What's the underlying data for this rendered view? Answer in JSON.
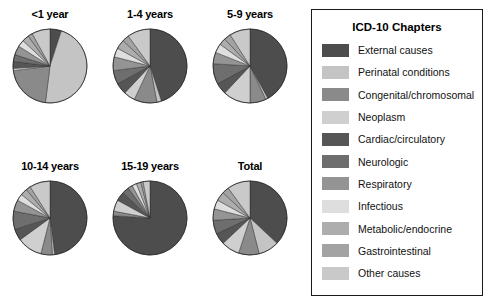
{
  "legend": {
    "title": "ICD-10 Chapters",
    "items": [
      {
        "label": "External causes",
        "color": "#4d4d4d"
      },
      {
        "label": "Perinatal conditions",
        "color": "#c4c4c4"
      },
      {
        "label": "Congenital/chromosomal",
        "color": "#8a8a8a"
      },
      {
        "label": "Neoplasm",
        "color": "#cfcfcf"
      },
      {
        "label": "Cardiac/circulatory",
        "color": "#565656"
      },
      {
        "label": "Neurologic",
        "color": "#6e6e6e"
      },
      {
        "label": "Respiratory",
        "color": "#949494"
      },
      {
        "label": "Infectious",
        "color": "#dedede"
      },
      {
        "label": "Metabolic/endocrine",
        "color": "#adadad"
      },
      {
        "label": "Gastrointestinal",
        "color": "#a3a3a3"
      },
      {
        "label": "Other causes",
        "color": "#c9c9c9"
      }
    ]
  },
  "chart_data": {
    "type": "pie",
    "title": "",
    "legend_position": "right",
    "legend_title": "ICD-10 Chapters",
    "categories": [
      "External causes",
      "Perinatal conditions",
      "Congenital/chromosomal",
      "Neoplasm",
      "Cardiac/circulatory",
      "Neurologic",
      "Respiratory",
      "Infectious",
      "Metabolic/endocrine",
      "Gastrointestinal",
      "Other causes"
    ],
    "colors": [
      "#4d4d4d",
      "#c4c4c4",
      "#8a8a8a",
      "#cfcfcf",
      "#565656",
      "#6e6e6e",
      "#949494",
      "#dedede",
      "#adadad",
      "#a3a3a3",
      "#c9c9c9"
    ],
    "series": [
      {
        "name": "<1 year",
        "values": [
          5,
          47,
          21,
          1,
          3,
          3,
          4,
          3,
          3,
          2,
          8
        ]
      },
      {
        "name": "1-4 years",
        "values": [
          45,
          2,
          10,
          5,
          5,
          6,
          6,
          4,
          4,
          3,
          10
        ]
      },
      {
        "name": "5-9 years",
        "values": [
          42,
          1,
          7,
          12,
          5,
          9,
          5,
          4,
          3,
          3,
          9
        ]
      },
      {
        "name": "10-14 years",
        "values": [
          48,
          1,
          5,
          11,
          5,
          8,
          5,
          3,
          3,
          2,
          9
        ]
      },
      {
        "name": "15-19 years",
        "values": [
          76,
          0,
          2,
          5,
          4,
          3,
          2,
          2,
          2,
          1,
          3
        ]
      },
      {
        "name": "Total",
        "values": [
          37,
          9,
          9,
          8,
          5,
          6,
          5,
          4,
          4,
          3,
          10
        ]
      }
    ]
  },
  "panels": [
    {
      "title": "<1 year"
    },
    {
      "title": "1-4 years"
    },
    {
      "title": "5-9 years"
    },
    {
      "title": "10-14 years"
    },
    {
      "title": "15-19 years"
    },
    {
      "title": "Total"
    }
  ]
}
